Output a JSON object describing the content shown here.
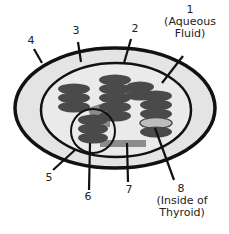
{
  "diagram": {
    "labels": [
      {
        "id": "1",
        "number": "1",
        "text": "(Aqueous\nFluid)"
      },
      {
        "id": "2",
        "number": "2",
        "text": ""
      },
      {
        "id": "3",
        "number": "3",
        "text": ""
      },
      {
        "id": "4",
        "number": "4",
        "text": ""
      },
      {
        "id": "5",
        "number": "5",
        "text": ""
      },
      {
        "id": "6",
        "number": "6",
        "text": ""
      },
      {
        "id": "7",
        "number": "7",
        "text": ""
      },
      {
        "id": "8",
        "number": "8",
        "text": "(Inside of\nThyroid)"
      }
    ],
    "colors": {
      "outline": "#111111",
      "fill_outer": "#e4e4e4",
      "fill_inner": "#e9e9e9",
      "stack": "#4a4a4a",
      "connector": "#8a8a8a",
      "highlight_disc": "#bdbdbd"
    }
  }
}
